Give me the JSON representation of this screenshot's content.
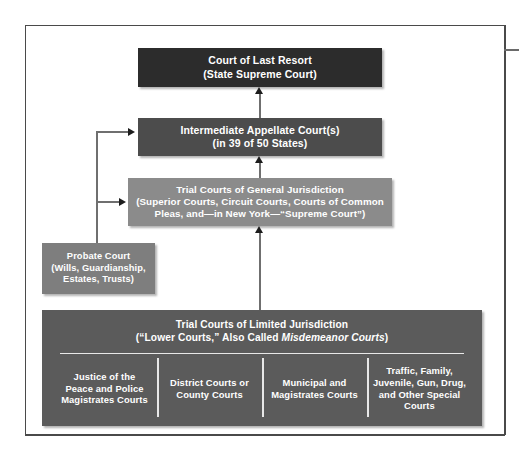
{
  "figure": {
    "nodes": {
      "last_resort": {
        "line1": "Court of Last Resort",
        "line2": "(State Supreme Court)"
      },
      "appellate": {
        "line1": "Intermediate Appellate Court(s)",
        "line2": "(in 39 of 50 States)"
      },
      "general": {
        "line1": "Trial Courts of General Jurisdiction",
        "line2": "(Superior Courts, Circuit Courts, Courts of Common",
        "line3": "Pleas, and—in New York—“Supreme Court”)"
      },
      "probate": {
        "line1": "Probate Court",
        "line2": "(Wills, Guardianship,",
        "line3": "Estates, Trusts)"
      },
      "limited": {
        "line1": "Trial Courts of Limited Jurisdiction",
        "line2_pre": "(“Lower Courts,” Also Called ",
        "line2_italic": "Misdemeanor Courts",
        "line2_post": ")",
        "columns": [
          {
            "line1": "Justice of the",
            "line2": "Peace and Police",
            "line3": "Magistrates Courts"
          },
          {
            "line1": "District Courts or",
            "line2": "County Courts",
            "line3": ""
          },
          {
            "line1": "Municipal and",
            "line2": "Magistrates Courts",
            "line3": ""
          },
          {
            "line1": "Traffic, Family,",
            "line2": "Juvenile, Gun, Drug,",
            "line3": "and Other Special",
            "line4": "Courts"
          }
        ]
      }
    },
    "colors": {
      "tier_last_resort": "#2c2c2c",
      "tier_appellate": "#4c4c4c",
      "tier_general": "#8b8b8b",
      "tier_probate": "#7e7e7e",
      "tier_limited": "#5b5b5b",
      "connector": "#6f6f6f",
      "arrowhead": "#1d1d1d",
      "frame_rule": "#4a4a4a",
      "text": "#ffffff",
      "page_background": "#ffffff"
    }
  }
}
